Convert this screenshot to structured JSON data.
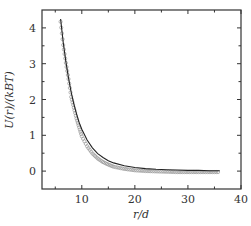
{
  "chart_data": {
    "type": "scatter",
    "title": "",
    "xlabel": "r/d",
    "ylabel": "U(r)/(k_B T)",
    "ylabel_display": "U(r)/(kBT)",
    "xlim": [
      2.5,
      40
    ],
    "ylim": [
      -0.5,
      4.5
    ],
    "x_ticks": [
      10,
      20,
      30,
      40
    ],
    "y_ticks": [
      0,
      1,
      2,
      3,
      4
    ],
    "x_tick_labels": [
      "10",
      "20",
      "30",
      "40"
    ],
    "y_tick_labels": [
      "0",
      "1",
      "2",
      "3",
      "4"
    ],
    "x_minor_ticks": [
      5,
      15,
      25,
      35
    ],
    "y_minor_ticks": [
      0.5,
      1.5,
      2.5,
      3.5
    ],
    "grid": false,
    "legend": null,
    "series": [
      {
        "name": "simulation data",
        "style": "open-circles",
        "color": "#999999",
        "x": [
          6.0,
          6.5,
          7.0,
          7.5,
          8.0,
          8.5,
          9.0,
          9.5,
          10.0,
          11.0,
          12.0,
          13.0,
          14.0,
          15.0,
          16.0,
          18.0,
          20.0,
          22.0,
          24.0,
          26.0,
          28.0,
          30.0,
          32.0,
          34.0,
          36.0
        ],
        "y": [
          4.2,
          3.55,
          3.05,
          2.6,
          2.1,
          1.8,
          1.5,
          1.25,
          1.0,
          0.72,
          0.52,
          0.38,
          0.28,
          0.21,
          0.15,
          0.09,
          0.05,
          0.03,
          0.02,
          0.01,
          0.0,
          0.0,
          0.0,
          0.0,
          0.0
        ]
      },
      {
        "name": "fit",
        "style": "solid-line",
        "color": "#222222",
        "x": [
          6.0,
          6.5,
          7.0,
          7.5,
          8.0,
          8.5,
          9.0,
          9.5,
          10.0,
          11.0,
          12.0,
          13.0,
          14.0,
          15.0,
          16.0,
          18.0,
          20.0,
          22.0,
          24.0,
          26.0,
          28.0,
          30.0,
          32.0,
          34.0,
          36.0
        ],
        "y": [
          4.25,
          3.6,
          3.05,
          2.6,
          2.2,
          1.88,
          1.6,
          1.36,
          1.17,
          0.87,
          0.65,
          0.49,
          0.38,
          0.29,
          0.23,
          0.15,
          0.1,
          0.07,
          0.05,
          0.04,
          0.03,
          0.02,
          0.02,
          0.01,
          0.01
        ]
      }
    ]
  }
}
